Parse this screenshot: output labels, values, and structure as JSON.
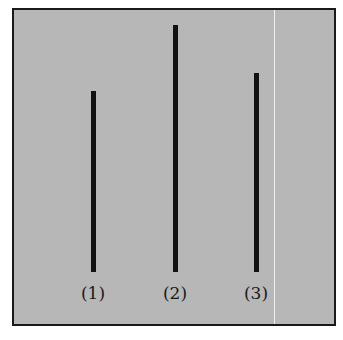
{
  "figure": {
    "background_color": "#b7b7b7",
    "border_color": "#1a1a1a",
    "line_color": "#111111",
    "lines": [
      {
        "label": "(1)",
        "x": 77,
        "top": 81,
        "bottom": 262
      },
      {
        "label": "(2)",
        "x": 159,
        "top": 15,
        "bottom": 262
      },
      {
        "label": "(3)",
        "x": 240,
        "top": 63,
        "bottom": 262
      }
    ]
  }
}
